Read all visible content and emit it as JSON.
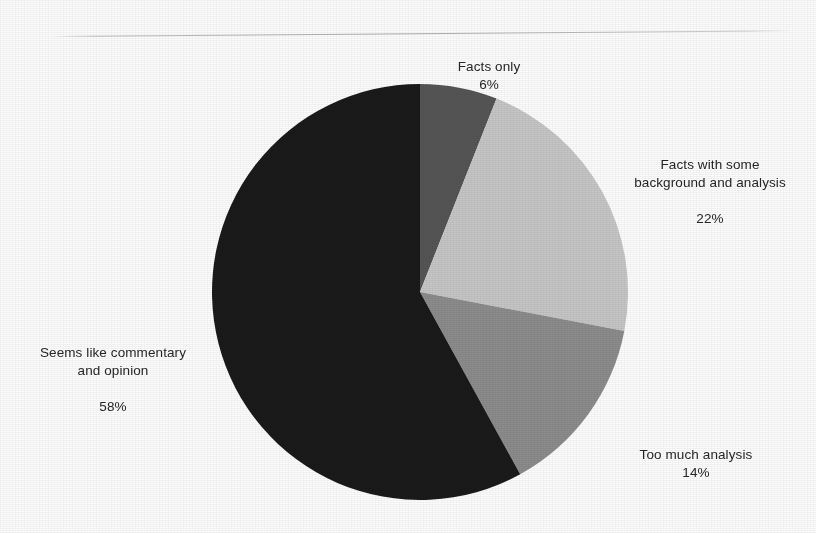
{
  "chart_data": {
    "type": "pie",
    "title": "",
    "subtitle": "",
    "xlabel": "",
    "ylabel": "",
    "legend_position": "none",
    "grid": false,
    "start_angle_deg": 0,
    "direction": "clockwise",
    "categories": [
      "Facts only",
      "Facts with some background and analysis",
      "Too much analysis",
      "Seems like commentary and opinion"
    ],
    "values": [
      6,
      22,
      14,
      58
    ],
    "value_labels": [
      "6%",
      "22%",
      "14%",
      "58%"
    ],
    "units": "percent",
    "colors": [
      "#555555",
      "#c6c6c6",
      "#8c8c8c",
      "#1a1a1a"
    ],
    "slices": [
      {
        "label": "Facts only",
        "label_line1": "Facts only",
        "value": 6,
        "value_label": "6%",
        "color": "#555555",
        "start_deg": 0,
        "end_deg": 21.6
      },
      {
        "label": "Facts with some background and analysis",
        "label_line1": "Facts with some",
        "label_line2": "background and analysis",
        "value": 22,
        "value_label": "22%",
        "color": "#c6c6c6",
        "start_deg": 21.6,
        "end_deg": 100.8
      },
      {
        "label": "Too much analysis",
        "label_line1": "Too much analysis",
        "value": 14,
        "value_label": "14%",
        "color": "#8c8c8c",
        "start_deg": 100.8,
        "end_deg": 151.2
      },
      {
        "label": "Seems like commentary and opinion",
        "label_line1": "Seems like commentary",
        "label_line2": "and opinion",
        "value": 58,
        "value_label": "58%",
        "color": "#1a1a1a",
        "start_deg": 151.2,
        "end_deg": 360
      }
    ]
  },
  "geometry": {
    "center_x": 420,
    "center_y": 292,
    "radius": 208
  },
  "background_color": "#fdfdfd"
}
